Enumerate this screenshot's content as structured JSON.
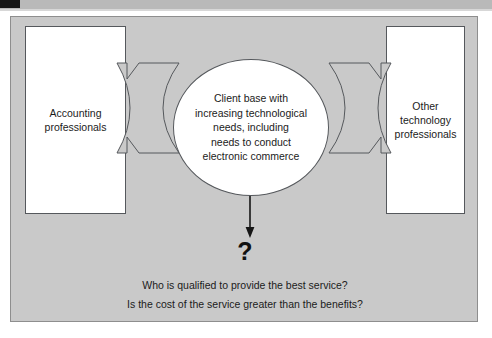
{
  "decor": {
    "top_bar_color": "#b9b9b9",
    "top_bar_marker_color": "#161616"
  },
  "canvas": {
    "background_color": "#c9c9c9",
    "border_color": "#8e8e8e"
  },
  "diagram": {
    "type": "flow",
    "left_node": {
      "label": "Accounting\nprofessionals",
      "line1": "Accounting",
      "line2": "professionals",
      "fill_color": "#ffffff",
      "border_color": "#55585c"
    },
    "right_node": {
      "label": "Other\ntechnology\nprofessionals",
      "line1": "Other",
      "line2": "technology",
      "line3": "professionals",
      "fill_color": "#ffffff",
      "border_color": "#55585c"
    },
    "center_node": {
      "shape": "ellipse",
      "line1": "Client base with",
      "line2": "increasing technological",
      "line3": "needs, including",
      "line4": "needs to conduct",
      "line5": "electronic commerce",
      "fill_color": "#ffffff",
      "border_color": "#55585c"
    },
    "connectors": {
      "left_arrow_name": "arrow-left-to-center",
      "right_arrow_name": "arrow-right-to-center",
      "down_arrow_name": "arrow-center-down"
    },
    "question_symbol": "?",
    "questions": [
      "Who is qualified to provide the best service?",
      "Is the cost of the service greater than the benefits?"
    ]
  }
}
